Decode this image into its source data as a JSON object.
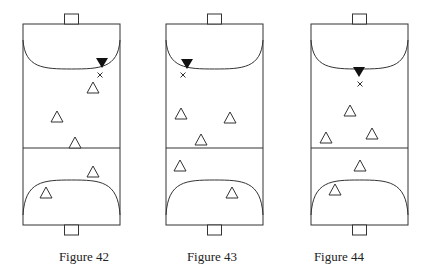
{
  "figures": [
    {
      "caption": "Figure 42",
      "court": {
        "left": 23,
        "right": 120,
        "top": 24,
        "bottom": 225,
        "center_y": 148
      },
      "defender": {
        "x": 102,
        "y": 63
      },
      "ball_x": {
        "x": 100,
        "y": 75
      },
      "attackers": [
        {
          "x": 93,
          "y": 88
        },
        {
          "x": 57,
          "y": 117
        },
        {
          "x": 75,
          "y": 143
        },
        {
          "x": 93,
          "y": 172
        },
        {
          "x": 46,
          "y": 193
        }
      ]
    },
    {
      "caption": "Figure 43",
      "court": {
        "left": 166,
        "right": 263,
        "top": 24,
        "bottom": 225,
        "center_y": 148
      },
      "defender": {
        "x": 187,
        "y": 64
      },
      "ball_x": {
        "x": 183,
        "y": 75
      },
      "attackers": [
        {
          "x": 181,
          "y": 114
        },
        {
          "x": 230,
          "y": 118
        },
        {
          "x": 201,
          "y": 140
        },
        {
          "x": 180,
          "y": 166
        },
        {
          "x": 232,
          "y": 193
        }
      ]
    },
    {
      "caption": "Figure 44",
      "court": {
        "left": 311,
        "right": 408,
        "top": 24,
        "bottom": 225,
        "center_y": 148
      },
      "defender": {
        "x": 359,
        "y": 72
      },
      "ball_x": {
        "x": 360,
        "y": 84
      },
      "attackers": [
        {
          "x": 350,
          "y": 111
        },
        {
          "x": 326,
          "y": 138
        },
        {
          "x": 372,
          "y": 134
        },
        {
          "x": 360,
          "y": 166
        },
        {
          "x": 335,
          "y": 190
        }
      ]
    }
  ],
  "colors": {
    "line": "#333333",
    "marker_fill": "#111111"
  }
}
